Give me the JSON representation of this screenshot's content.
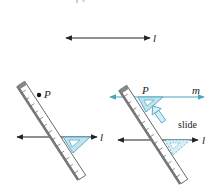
{
  "figure": {
    "top_fragment": "",
    "step1": {
      "line_label": "l"
    },
    "step2": {
      "point_label": "P",
      "line_label": "l"
    },
    "step3": {
      "point_label": "P",
      "new_line_label": "m",
      "line_label": "l",
      "action_label": "slide"
    },
    "colors": {
      "line": "#222222",
      "accent": "#4aa3c0",
      "triangle_fill": "#bfe3ef",
      "ruler_fill": "#ffffff",
      "ruler_edge": "#555555"
    }
  }
}
